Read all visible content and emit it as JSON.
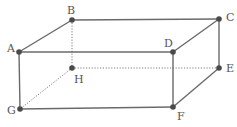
{
  "figure": {
    "colors": {
      "edge": "#6a6a6a",
      "hidden_edge": "#7a7a7a",
      "vertex": "#4a4a4a",
      "label": "#555555"
    },
    "vertices": [
      {
        "name": "A",
        "label": "A",
        "x": 19,
        "y": 52,
        "lx": 7,
        "ly": 52
      },
      {
        "name": "B",
        "label": "B",
        "x": 72,
        "y": 20,
        "lx": 67,
        "ly": 14
      },
      {
        "name": "C",
        "label": "C",
        "x": 219,
        "y": 19,
        "lx": 226,
        "ly": 21
      },
      {
        "name": "D",
        "label": "D",
        "x": 173,
        "y": 52,
        "lx": 164,
        "ly": 47
      },
      {
        "name": "E",
        "label": "E",
        "x": 219,
        "y": 68,
        "lx": 226,
        "ly": 72
      },
      {
        "name": "F",
        "label": "F",
        "x": 173,
        "y": 107,
        "lx": 177,
        "ly": 120
      },
      {
        "name": "G",
        "label": "G",
        "x": 20,
        "y": 109,
        "lx": 7,
        "ly": 114
      },
      {
        "name": "H",
        "label": "H",
        "x": 72,
        "y": 68,
        "lx": 74,
        "ly": 83
      }
    ],
    "solid_edges": [
      [
        "A",
        "B"
      ],
      [
        "B",
        "C"
      ],
      [
        "C",
        "D"
      ],
      [
        "D",
        "A"
      ],
      [
        "A",
        "G"
      ],
      [
        "D",
        "F"
      ],
      [
        "C",
        "E"
      ],
      [
        "G",
        "F"
      ],
      [
        "F",
        "E"
      ]
    ],
    "hidden_edges": [
      [
        "B",
        "H"
      ],
      [
        "H",
        "E"
      ],
      [
        "H",
        "G"
      ]
    ]
  }
}
